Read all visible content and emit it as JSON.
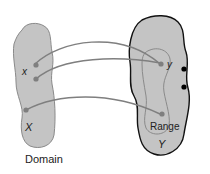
{
  "diagram": {
    "type": "function-mapping",
    "domain_set": {
      "name": "X",
      "caption": "Domain",
      "point_label": "x"
    },
    "codomain_set": {
      "name": "Y",
      "range_label": "Range",
      "point_label": "y"
    },
    "colors": {
      "set_fill": "#c4c4c4",
      "domain_stroke": "#8a8a8a",
      "codomain_stroke": "#111111",
      "arrow": "#7f7f7f",
      "point": "#7f7f7f",
      "outside_point": "#000000"
    },
    "mappings": [
      {
        "from": "x1",
        "to": "y"
      },
      {
        "from": "x2",
        "to": "y"
      },
      {
        "from": "x3",
        "to": "r2"
      }
    ]
  }
}
